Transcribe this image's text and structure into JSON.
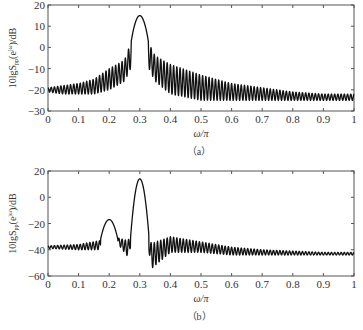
{
  "chart_data": [
    {
      "type": "line",
      "panel": "a",
      "caption": "(a)",
      "xlabel": "ω/π",
      "ylabel": "10lgS_pp(e^jω)/dB",
      "xlim": [
        0,
        1
      ],
      "ylim": [
        -30,
        20
      ],
      "xticks": [
        "0",
        "0.1",
        "0.2",
        "0.3",
        "0.4",
        "0.5",
        "0.6",
        "0.7",
        "0.8",
        "0.9",
        "1"
      ],
      "yticks": [
        "20",
        "10",
        "0",
        "-10",
        "-20",
        "-30"
      ],
      "grid": false,
      "series": [
        {
          "name": "spectrum",
          "description": "Single main lobe at ω/π=0.3 peaking ~15 dB, dense sidelobes decaying from ~0 dB near peak to ~-22 dB at edges",
          "x": [
            0,
            0.05,
            0.1,
            0.15,
            0.2,
            0.25,
            0.27,
            0.3,
            0.33,
            0.35,
            0.4,
            0.5,
            0.6,
            0.7,
            0.8,
            0.9,
            1.0
          ],
          "upper_envelope": [
            -19,
            -18,
            -17,
            -15,
            -10,
            -6,
            2,
            15,
            2,
            -4,
            -8,
            -13,
            -17,
            -19,
            -21,
            -22,
            -22
          ],
          "lower_envelope": [
            -21,
            -22,
            -22,
            -22,
            -20,
            -16,
            -10,
            15,
            -10,
            -16,
            -22,
            -25,
            -25,
            -25,
            -25,
            -25,
            -25
          ]
        }
      ]
    },
    {
      "type": "line",
      "panel": "b",
      "caption": "(b)",
      "xlabel": "ω/π",
      "ylabel": "10lgS_pp(e^jω)/dB",
      "xlim": [
        0,
        1
      ],
      "ylim": [
        -60,
        20
      ],
      "xticks": [
        "0",
        "0.1",
        "0.2",
        "0.3",
        "0.4",
        "0.5",
        "0.6",
        "0.7",
        "0.8",
        "0.9",
        "1"
      ],
      "yticks": [
        "20",
        "0",
        "-20",
        "-40",
        "-60"
      ],
      "grid": false,
      "series": [
        {
          "name": "spectrum",
          "description": "Two lobes: small lobe at ω/π=0.2 (~-17 dB), main lobe at ω/π=0.3 (~14 dB); sidelobe floor ~-38 to -43 dB, dip to ~-54 dB near 0.34",
          "x": [
            0,
            0.1,
            0.17,
            0.2,
            0.23,
            0.26,
            0.27,
            0.3,
            0.33,
            0.34,
            0.4,
            0.5,
            0.6,
            0.7,
            0.8,
            0.9,
            1.0
          ],
          "upper_envelope": [
            -37,
            -36,
            -33,
            -17,
            -31,
            -33,
            -30,
            14,
            -33,
            -35,
            -30,
            -34,
            -38,
            -40,
            -41,
            -42,
            -42
          ],
          "lower_envelope": [
            -39,
            -40,
            -40,
            -17,
            -36,
            -45,
            -38,
            14,
            -42,
            -54,
            -42,
            -42,
            -44,
            -44,
            -44,
            -44,
            -44
          ]
        }
      ]
    }
  ],
  "panels": {
    "a": {
      "caption": "(a)",
      "xlabel": "ω/π",
      "ylabel_main": "10lgS",
      "ylabel_sub": "pp",
      "ylabel_paren": "(e",
      "ylabel_sup": "jω",
      "ylabel_tail": ")/dB"
    },
    "b": {
      "caption": "(b)",
      "xlabel": "ω/π",
      "ylabel_main": "10lgS",
      "ylabel_sub": "pp",
      "ylabel_paren": "(e",
      "ylabel_sup": "jω",
      "ylabel_tail": ")/dB"
    }
  },
  "colors": {
    "line": "#111111",
    "axis": "#555555",
    "background": "#ffffff"
  }
}
